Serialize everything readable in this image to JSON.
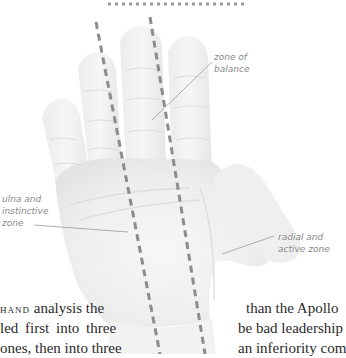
{
  "figure": {
    "labels": {
      "zone_of_balance": [
        "zone of",
        "balance"
      ],
      "ulna_zone": [
        "ulna and",
        "instinctive",
        "zone"
      ],
      "radial_zone": [
        "radial and",
        "active zone"
      ]
    },
    "colors": {
      "dash_line": "#8c8c8c",
      "leader_line": "#9a9a9a",
      "label_text": "#8a8a8a",
      "hand_fill": "#f0f0f0",
      "hand_shadow": "#e2e2e2"
    }
  },
  "text": {
    "left_column": {
      "line1_smallcaps": "hand",
      "line1_rest": " analysis the",
      "line2": "led first into three",
      "line3": "ones, then into three"
    },
    "right_column": {
      "line1": "than the Apollo",
      "line2": "be bad leadership",
      "line3": "an inferiority com"
    }
  }
}
